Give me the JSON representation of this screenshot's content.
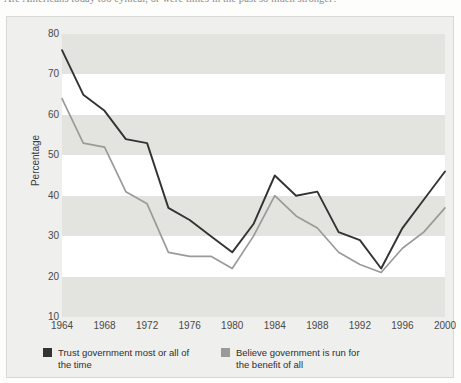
{
  "caption": {
    "text": "Are Americans today too cynical, or were times in the past so much stronger?"
  },
  "figure": {
    "background_color": "#efefed",
    "plot_background_color": "#ffffff",
    "band_color": "#e3e3e0"
  },
  "legend": {
    "position": "below",
    "entries": [
      {
        "label": "Trust government most or all of the time",
        "color": "#333333"
      },
      {
        "label": "Believe government is run for the benefit of all",
        "color": "#9a9a96"
      }
    ]
  },
  "chart_data": {
    "type": "line",
    "title": "",
    "subtitle": "",
    "xlabel": "",
    "ylabel": "Percentage",
    "xlim": [
      1964,
      2000
    ],
    "ylim": [
      10,
      80
    ],
    "yticks": [
      80,
      70,
      60,
      50,
      40,
      30,
      20,
      10
    ],
    "xticks": [
      1964,
      1968,
      1972,
      1976,
      1980,
      1984,
      1988,
      1992,
      1996,
      2000
    ],
    "grid": "horizontal-bands",
    "x": [
      1964,
      1966,
      1968,
      1970,
      1972,
      1974,
      1976,
      1978,
      1980,
      1982,
      1984,
      1986,
      1988,
      1990,
      1992,
      1994,
      1996,
      1998,
      2000
    ],
    "series": [
      {
        "name": "Trust government most or all of the time",
        "color": "#333333",
        "values": [
          76,
          65,
          61,
          54,
          53,
          37,
          34,
          30,
          26,
          33,
          45,
          40,
          41,
          31,
          29,
          22,
          32,
          39,
          46
        ]
      },
      {
        "name": "Believe government is run for the benefit of all",
        "color": "#9a9a96",
        "values": [
          64,
          53,
          52,
          41,
          38,
          26,
          25,
          25,
          22,
          30,
          40,
          35,
          32,
          26,
          23,
          21,
          27,
          31,
          37
        ]
      }
    ]
  }
}
